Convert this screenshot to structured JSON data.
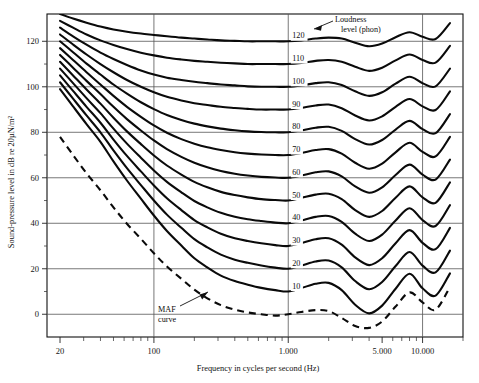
{
  "chart_data": {
    "type": "line",
    "title": "",
    "xlabel": "Frequency in cycles per second (Hz)",
    "ylabel": "Sound-pressure level in dB re 20µN/m²",
    "xscale": "log",
    "xlim": [
      16,
      20000
    ],
    "ylim": [
      -10,
      132
    ],
    "grid": true,
    "legend": "none",
    "x_ticks_major": [
      "20",
      "100",
      "1.000",
      "5.000",
      "10.000"
    ],
    "x_ticks_major_values": [
      20,
      100,
      1000,
      5000,
      10000
    ],
    "x_gridline_values": [
      100,
      1000,
      10000
    ],
    "x_minor_tick_values": [
      30,
      40,
      50,
      60,
      70,
      80,
      90,
      200,
      300,
      400,
      500,
      600,
      700,
      800,
      900,
      2000,
      3000,
      4000,
      6000,
      7000,
      8000,
      9000,
      20000
    ],
    "y_ticks_major": [
      "0",
      "20",
      "40",
      "60",
      "80",
      "100",
      "120"
    ],
    "y_ticks_major_values": [
      0,
      20,
      40,
      60,
      80,
      100,
      120
    ],
    "y_minor_tick_values": [
      10,
      30,
      50,
      70,
      90,
      110
    ],
    "annotations": [
      {
        "name": "loudness-level-annotation",
        "line1": "Loudness",
        "line2": "level (phon)"
      },
      {
        "name": "maf-annotation",
        "line1": "MAF",
        "line2": "curve"
      }
    ],
    "phon_labels": [
      "120",
      "110",
      "100",
      "90",
      "80",
      "70",
      "60",
      "50",
      "40",
      "30",
      "20",
      "10"
    ],
    "series": [
      {
        "name": "120 phon",
        "phon": 120,
        "label": "120",
        "x": [
          20,
          25,
          31.5,
          40,
          50,
          63,
          80,
          100,
          125,
          160,
          200,
          250,
          315,
          400,
          500,
          630,
          800,
          1000,
          1250,
          1600,
          2000,
          2500,
          3150,
          4000,
          5000,
          6300,
          8000,
          10000,
          12500,
          16000
        ],
        "y": [
          132.0,
          130.0,
          128.2,
          126.5,
          125.2,
          124.2,
          123.4,
          122.8,
          122.2,
          121.6,
          121.2,
          120.8,
          120.4,
          120.2,
          120.0,
          120.0,
          120.0,
          120.0,
          120.4,
          121.2,
          121.6,
          121.2,
          119.4,
          117.8,
          119.0,
          121.8,
          124.0,
          122.0,
          121.0,
          128.0
        ]
      },
      {
        "name": "110 phon",
        "phon": 110,
        "label": "110",
        "x": [
          20,
          25,
          31.5,
          40,
          50,
          63,
          80,
          100,
          125,
          160,
          200,
          250,
          315,
          400,
          500,
          630,
          800,
          1000,
          1250,
          1600,
          2000,
          2500,
          3150,
          4000,
          5000,
          6300,
          8000,
          10000,
          12500,
          16000
        ],
        "y": [
          129.0,
          126.0,
          123.0,
          120.4,
          118.4,
          116.6,
          115.0,
          113.8,
          112.8,
          112.0,
          111.4,
          111.0,
          110.6,
          110.3,
          110.0,
          110.0,
          110.0,
          110.0,
          110.5,
          111.4,
          111.8,
          111.0,
          108.8,
          107.0,
          108.4,
          111.6,
          114.2,
          111.8,
          110.6,
          118.0
        ]
      },
      {
        "name": "100 phon",
        "phon": 100,
        "label": "100",
        "x": [
          20,
          25,
          31.5,
          40,
          50,
          63,
          80,
          100,
          125,
          160,
          200,
          250,
          315,
          400,
          500,
          630,
          800,
          1000,
          1250,
          1600,
          2000,
          2500,
          3150,
          4000,
          5000,
          6300,
          8000,
          10000,
          12500,
          16000
        ],
        "y": [
          126.0,
          122.2,
          118.5,
          115.0,
          112.2,
          109.6,
          107.2,
          105.4,
          104.0,
          103.0,
          102.2,
          101.6,
          101.0,
          100.6,
          100.2,
          100.0,
          100.0,
          100.0,
          100.6,
          101.6,
          102.0,
          100.8,
          98.0,
          96.0,
          97.6,
          101.4,
          104.4,
          101.6,
          100.2,
          108.0
        ]
      },
      {
        "name": "90 phon",
        "phon": 90,
        "label": "90",
        "x": [
          20,
          25,
          31.5,
          40,
          50,
          63,
          80,
          100,
          125,
          160,
          200,
          250,
          315,
          400,
          500,
          630,
          800,
          1000,
          1250,
          1600,
          2000,
          2500,
          3150,
          4000,
          5000,
          6300,
          8000,
          10000,
          12500,
          16000
        ],
        "y": [
          123.0,
          118.6,
          114.2,
          110.0,
          106.4,
          103.0,
          100.0,
          97.6,
          95.6,
          94.0,
          92.8,
          92.0,
          91.2,
          90.7,
          90.3,
          90.0,
          90.0,
          90.0,
          90.7,
          91.8,
          92.2,
          90.6,
          87.4,
          85.2,
          87.0,
          91.2,
          94.6,
          91.4,
          89.8,
          98.0
        ]
      },
      {
        "name": "80 phon",
        "phon": 80,
        "label": "80",
        "x": [
          20,
          25,
          31.5,
          40,
          50,
          63,
          80,
          100,
          125,
          160,
          200,
          250,
          315,
          400,
          500,
          630,
          800,
          1000,
          1250,
          1600,
          2000,
          2500,
          3150,
          4000,
          5000,
          6300,
          8000,
          10000,
          12500,
          16000
        ],
        "y": [
          120.0,
          115.2,
          110.2,
          105.4,
          101.0,
          97.0,
          93.2,
          90.2,
          87.6,
          85.4,
          83.8,
          82.6,
          81.6,
          80.9,
          80.4,
          80.1,
          80.0,
          80.0,
          80.8,
          82.0,
          82.4,
          80.6,
          77.0,
          74.6,
          76.6,
          81.2,
          85.0,
          81.4,
          79.6,
          88.0
        ]
      },
      {
        "name": "70 phon",
        "phon": 70,
        "label": "70",
        "x": [
          20,
          25,
          31.5,
          40,
          50,
          63,
          80,
          100,
          125,
          160,
          200,
          250,
          315,
          400,
          500,
          630,
          800,
          1000,
          1250,
          1600,
          2000,
          2500,
          3150,
          4000,
          5000,
          6300,
          8000,
          10000,
          12500,
          16000
        ],
        "y": [
          117.0,
          111.8,
          106.4,
          101.0,
          96.0,
          91.2,
          86.8,
          83.0,
          79.8,
          77.0,
          75.0,
          73.4,
          72.2,
          71.2,
          70.6,
          70.2,
          70.0,
          70.0,
          70.9,
          72.2,
          72.6,
          70.6,
          66.6,
          64.0,
          66.2,
          71.2,
          75.4,
          71.4,
          69.4,
          78.0
        ]
      },
      {
        "name": "60 phon",
        "phon": 60,
        "label": "60",
        "x": [
          20,
          25,
          31.5,
          40,
          50,
          63,
          80,
          100,
          125,
          160,
          200,
          250,
          315,
          400,
          500,
          630,
          800,
          1000,
          1250,
          1600,
          2000,
          2500,
          3150,
          4000,
          5000,
          6300,
          8000,
          10000,
          12500,
          16000
        ],
        "y": [
          114.0,
          108.4,
          102.6,
          96.8,
          91.2,
          85.8,
          80.8,
          76.4,
          72.6,
          69.2,
          66.6,
          64.6,
          63.0,
          61.8,
          61.0,
          60.4,
          60.1,
          60.0,
          61.0,
          62.4,
          62.8,
          60.6,
          56.2,
          53.4,
          55.8,
          61.2,
          65.8,
          61.4,
          59.2,
          68.0
        ]
      },
      {
        "name": "50 phon",
        "phon": 50,
        "label": "50",
        "x": [
          20,
          25,
          31.5,
          40,
          50,
          63,
          80,
          100,
          125,
          160,
          200,
          250,
          315,
          400,
          500,
          630,
          800,
          1000,
          1250,
          1600,
          2000,
          2500,
          3150,
          4000,
          5000,
          6300,
          8000,
          10000,
          12500,
          16000
        ],
        "y": [
          111.0,
          105.0,
          98.8,
          92.6,
          86.4,
          80.4,
          74.8,
          69.8,
          65.4,
          61.4,
          58.2,
          55.8,
          53.8,
          52.4,
          51.4,
          50.6,
          50.2,
          50.0,
          51.1,
          52.6,
          53.0,
          50.6,
          45.8,
          42.8,
          45.4,
          51.2,
          56.2,
          51.4,
          49.0,
          58.0
        ]
      },
      {
        "name": "40 phon",
        "phon": 40,
        "label": "40",
        "x": [
          20,
          25,
          31.5,
          40,
          50,
          63,
          80,
          100,
          125,
          160,
          200,
          250,
          315,
          400,
          500,
          630,
          800,
          1000,
          1250,
          1600,
          2000,
          2500,
          3150,
          4000,
          5000,
          6300,
          8000,
          10000,
          12500,
          16000
        ],
        "y": [
          108.0,
          101.6,
          95.0,
          88.4,
          81.6,
          75.0,
          68.8,
          63.2,
          58.2,
          53.6,
          49.8,
          47.0,
          44.6,
          42.9,
          41.8,
          41.0,
          40.3,
          40.0,
          41.2,
          42.8,
          43.2,
          40.6,
          35.4,
          32.2,
          35.0,
          41.2,
          46.6,
          41.4,
          38.8,
          48.0
        ]
      },
      {
        "name": "30 phon",
        "phon": 30,
        "label": "30",
        "x": [
          20,
          25,
          31.5,
          40,
          50,
          63,
          80,
          100,
          125,
          160,
          200,
          250,
          315,
          400,
          500,
          630,
          800,
          1000,
          1250,
          1600,
          2000,
          2500,
          3150,
          4000,
          5000,
          6300,
          8000,
          10000,
          12500,
          16000
        ],
        "y": [
          105.0,
          98.2,
          91.2,
          84.2,
          76.8,
          69.6,
          62.8,
          56.6,
          51.0,
          45.8,
          41.4,
          38.2,
          35.4,
          33.4,
          32.2,
          31.2,
          30.4,
          30.0,
          31.3,
          33.0,
          33.4,
          30.6,
          25.0,
          21.6,
          24.6,
          31.2,
          37.0,
          31.4,
          28.6,
          38.0
        ]
      },
      {
        "name": "20 phon",
        "phon": 20,
        "label": "20",
        "x": [
          20,
          25,
          31.5,
          40,
          50,
          63,
          80,
          100,
          125,
          160,
          200,
          250,
          315,
          400,
          500,
          630,
          800,
          1000,
          1250,
          1600,
          2000,
          2500,
          3150,
          4000,
          5000,
          6300,
          8000,
          10000,
          12500,
          16000
        ],
        "y": [
          102.0,
          94.8,
          87.4,
          80.0,
          72.0,
          64.2,
          56.8,
          50.0,
          43.8,
          38.0,
          33.0,
          29.4,
          26.2,
          24.0,
          22.6,
          21.4,
          20.5,
          20.0,
          21.4,
          23.2,
          23.6,
          20.6,
          14.6,
          11.0,
          14.2,
          21.2,
          27.4,
          21.4,
          18.4,
          28.0
        ]
      },
      {
        "name": "10 phon",
        "phon": 10,
        "label": "10",
        "x": [
          20,
          25,
          31.5,
          40,
          50,
          63,
          80,
          100,
          125,
          160,
          200,
          250,
          315,
          400,
          500,
          630,
          800,
          1000,
          1250,
          1600,
          2000,
          2500,
          3150,
          4000,
          5000,
          6300,
          8000,
          10000,
          12500,
          16000
        ],
        "y": [
          99.0,
          91.4,
          83.6,
          75.8,
          67.2,
          58.8,
          50.8,
          43.4,
          36.6,
          30.2,
          24.6,
          20.6,
          17.0,
          14.6,
          13.0,
          11.6,
          10.6,
          10.0,
          11.5,
          13.4,
          13.8,
          10.6,
          4.2,
          0.4,
          3.8,
          11.2,
          17.8,
          11.4,
          8.2,
          18.0
        ]
      },
      {
        "name": "MAF curve",
        "phon": 0,
        "label": "MAF",
        "style": "dashed",
        "x": [
          20,
          25,
          31.5,
          40,
          50,
          63,
          80,
          100,
          125,
          160,
          200,
          250,
          315,
          400,
          500,
          630,
          800,
          1000,
          1250,
          1600,
          2000,
          2500,
          3150,
          4000,
          5000,
          6300,
          8000,
          10000,
          12500,
          16000
        ],
        "y": [
          78.0,
          70.0,
          62.0,
          54.5,
          47.0,
          39.8,
          33.2,
          26.8,
          21.0,
          15.6,
          10.8,
          7.0,
          4.0,
          2.0,
          0.8,
          0.0,
          -0.6,
          0.0,
          1.0,
          1.8,
          1.4,
          -1.6,
          -5.2,
          -6.0,
          -3.2,
          3.4,
          9.6,
          5.2,
          2.0,
          12.0
        ]
      }
    ]
  }
}
